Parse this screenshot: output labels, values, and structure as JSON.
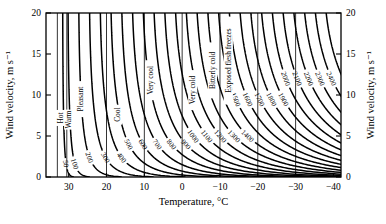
{
  "chart_data": {
    "type": "line",
    "title": "",
    "xlabel": "Temperature, °C",
    "ylabel": "Wind velocity, m s⁻¹",
    "xlim": [
      36,
      -42
    ],
    "ylim": [
      0,
      20
    ],
    "grid": false,
    "legend": "none",
    "x_ticks": [
      "30",
      "20",
      "10",
      "0",
      "−10",
      "−20",
      "−30",
      "−40"
    ],
    "x_tick_values": [
      30,
      20,
      10,
      0,
      -10,
      -20,
      -30,
      -40
    ],
    "y_ticks": [
      "0",
      "5",
      "10",
      "15",
      "20"
    ],
    "y_tick_values": [
      0,
      5,
      10,
      15,
      20
    ],
    "curve_unit": "W m⁻²",
    "curve_labels": [
      "50",
      "100",
      "200",
      "300",
      "400",
      "500",
      "600",
      "700",
      "800",
      "900",
      "1000",
      "1100",
      "1200",
      "1300",
      "1400",
      "1500",
      "1600",
      "1700",
      "1800",
      "1900",
      "2000",
      "2100",
      "2200",
      "2300",
      "2400",
      "2500"
    ],
    "curve_values": [
      50,
      100,
      200,
      300,
      400,
      500,
      600,
      700,
      800,
      900,
      1000,
      1100,
      1200,
      1300,
      1400,
      1500,
      1600,
      1700,
      1800,
      1900,
      2000,
      2100,
      2200,
      2300,
      2400,
      2500
    ],
    "zone_labels": [
      "Hot",
      "Warm",
      "Pleasant",
      "Cool",
      "Very cool",
      "Very cold",
      "Bitterly cold",
      "Exposed flesh freezes"
    ],
    "zone_boundaries_c": [
      33.0,
      30.5,
      20.0,
      10.0,
      0.0,
      -10.0,
      -20.0,
      -30.0
    ],
    "series": [
      {
        "name": "50",
        "values": [
          50
        ]
      },
      {
        "name": "100",
        "values": [
          100
        ]
      },
      {
        "name": "200",
        "values": [
          200
        ]
      },
      {
        "name": "300",
        "values": [
          300
        ]
      },
      {
        "name": "400",
        "values": [
          400
        ]
      },
      {
        "name": "500",
        "values": [
          500
        ]
      },
      {
        "name": "600",
        "values": [
          600
        ]
      },
      {
        "name": "700",
        "values": [
          700
        ]
      },
      {
        "name": "800",
        "values": [
          800
        ]
      },
      {
        "name": "900",
        "values": [
          900
        ]
      },
      {
        "name": "1000",
        "values": [
          1000
        ]
      },
      {
        "name": "1100",
        "values": [
          1100
        ]
      },
      {
        "name": "1200",
        "values": [
          1200
        ]
      },
      {
        "name": "1300",
        "values": [
          1300
        ]
      },
      {
        "name": "1400",
        "values": [
          1400
        ]
      },
      {
        "name": "1500",
        "values": [
          1500
        ]
      },
      {
        "name": "1600",
        "values": [
          1600
        ]
      },
      {
        "name": "1700",
        "values": [
          1700
        ]
      },
      {
        "name": "1800",
        "values": [
          1800
        ]
      },
      {
        "name": "1900",
        "values": [
          1900
        ]
      },
      {
        "name": "2000",
        "values": [
          2000
        ]
      },
      {
        "name": "2100",
        "values": [
          2100
        ]
      },
      {
        "name": "2200",
        "values": [
          2200
        ]
      },
      {
        "name": "2300",
        "values": [
          2300
        ]
      },
      {
        "name": "2400",
        "values": [
          2400
        ]
      },
      {
        "name": "2500",
        "values": [
          2500
        ]
      }
    ]
  },
  "axes": {
    "x_title": "Temperature, °C",
    "y_title_left": "Wind velocity, m s⁻¹",
    "y_title_right": "Wind velocity, m s⁻¹"
  },
  "colors": {
    "line": "#000000",
    "background": "#ffffff",
    "axis": "#000000"
  }
}
